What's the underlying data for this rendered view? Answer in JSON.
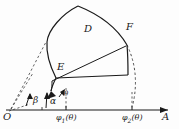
{
  "figure": {
    "type": "geometry-diagram",
    "background_color": "#fdfdfd",
    "stroke_color": "#1a1a1a",
    "labels": {
      "origin": "O",
      "axis_end": "A",
      "region": "D",
      "point_e": "E",
      "point_f": "F",
      "angle_beta": "β",
      "angle_alpha": "α",
      "angle_theta": "θ",
      "axis_tick_1_main": "φ",
      "axis_tick_1_sub": "1",
      "axis_tick_1_arg": "(θ)",
      "axis_tick_2_main": "φ",
      "axis_tick_2_sub": "2",
      "axis_tick_2_arg": "(θ)"
    },
    "geometry": {
      "origin_px": [
        10,
        110
      ],
      "axis_y_px": 110,
      "axis_x_start_px": 6,
      "axis_x_end_px": 172,
      "tick_phi1_x_px": 66,
      "tick_phi2_x_px": 132,
      "point_e_px": [
        56,
        77
      ],
      "point_f_px": [
        126,
        46
      ],
      "region_top_vertex_px": [
        78,
        6
      ],
      "region_left_px": [
        47,
        42
      ]
    }
  }
}
